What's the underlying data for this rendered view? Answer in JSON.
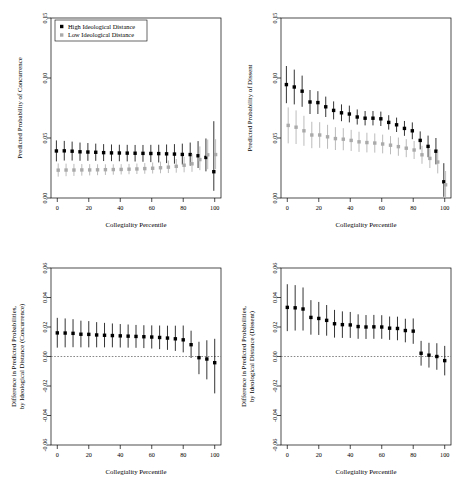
{
  "figure": {
    "background": "#ffffff",
    "series_colors": {
      "high": "#000000",
      "low": "#aaaaaa"
    }
  },
  "legend": {
    "present_on_panel": "top-left",
    "items": [
      {
        "label": "High Ideological Distance",
        "marker": "filled-square",
        "color": "#000000"
      },
      {
        "label": "Low Ideological Distance",
        "marker": "filled-square",
        "color": "#aaaaaa"
      }
    ]
  },
  "chart_data": [
    {
      "id": "panel-concurrence",
      "type": "scatter",
      "position": "top-left",
      "title": "",
      "xlabel": "Collegiality Percentile",
      "ylabel": "Predicted Probability of Concurrence",
      "xlim": [
        -4,
        104
      ],
      "ylim": [
        0.0,
        0.15
      ],
      "xticks": [
        0,
        20,
        40,
        60,
        80,
        100
      ],
      "yticks": [
        0.0,
        0.05,
        0.1,
        0.15
      ],
      "ytick_labels": [
        "0.00",
        "0.05",
        "0.10",
        "0.15"
      ],
      "xtick_labels": [
        "0",
        "20",
        "40",
        "60",
        "80",
        "100"
      ],
      "grid": false,
      "legend": "top-left",
      "x": [
        0,
        5,
        10,
        15,
        20,
        25,
        30,
        35,
        40,
        45,
        50,
        55,
        60,
        65,
        70,
        75,
        80,
        85,
        90,
        95,
        100
      ],
      "series": [
        {
          "name": "High Ideological Distance",
          "color": "#000000",
          "values": [
            0.0392,
            0.0393,
            0.039,
            0.0385,
            0.0383,
            0.0381,
            0.0378,
            0.0376,
            0.0375,
            0.0374,
            0.0373,
            0.0372,
            0.0371,
            0.037,
            0.0368,
            0.0366,
            0.0363,
            0.0362,
            0.0352,
            0.0338,
            0.0219
          ],
          "lower": [
            0.0305,
            0.0312,
            0.0312,
            0.031,
            0.031,
            0.031,
            0.0308,
            0.0307,
            0.0306,
            0.0305,
            0.0304,
            0.0302,
            0.0299,
            0.0296,
            0.0291,
            0.0286,
            0.0279,
            0.0269,
            0.025,
            0.0222,
            0.006
          ],
          "upper": [
            0.048,
            0.0476,
            0.047,
            0.0462,
            0.0458,
            0.0453,
            0.0449,
            0.0446,
            0.0444,
            0.0443,
            0.0442,
            0.0442,
            0.0443,
            0.0444,
            0.0446,
            0.0449,
            0.0453,
            0.0462,
            0.0474,
            0.0496,
            0.064
          ]
        },
        {
          "name": "Low Ideological Distance",
          "color": "#aaaaaa",
          "values": [
            0.0232,
            0.0233,
            0.0233,
            0.0234,
            0.0234,
            0.0235,
            0.0236,
            0.0237,
            0.0238,
            0.024,
            0.0242,
            0.0245,
            0.0248,
            0.0252,
            0.0257,
            0.0264,
            0.0273,
            0.0285,
            0.032,
            0.036,
            0.0362
          ],
          "lower": [
            0.0178,
            0.0182,
            0.0184,
            0.0186,
            0.0188,
            0.019,
            0.0192,
            0.0194,
            0.0196,
            0.0198,
            0.02,
            0.0202,
            0.0204,
            0.0206,
            0.0208,
            0.0211,
            0.0214,
            0.0218,
            0.0232,
            0.024,
            0.024
          ],
          "upper": [
            0.0288,
            0.0286,
            0.0284,
            0.0283,
            0.0282,
            0.0281,
            0.0281,
            0.0281,
            0.0282,
            0.0284,
            0.0287,
            0.0291,
            0.0296,
            0.0303,
            0.0312,
            0.0325,
            0.0343,
            0.0368,
            0.043,
            0.0487,
            0.049
          ]
        }
      ]
    },
    {
      "id": "panel-dissent",
      "type": "scatter",
      "position": "top-right",
      "title": "",
      "xlabel": "Collegiality Percentile",
      "ylabel": "Predicted Probability of Dissent",
      "xlim": [
        -4,
        104
      ],
      "ylim": [
        0.0,
        0.15
      ],
      "xticks": [
        0,
        20,
        40,
        60,
        80,
        100
      ],
      "yticks": [
        0.0,
        0.05,
        0.1,
        0.15
      ],
      "ytick_labels": [
        "0.00",
        "0.05",
        "0.10",
        "0.15"
      ],
      "xtick_labels": [
        "0",
        "20",
        "40",
        "60",
        "80",
        "100"
      ],
      "grid": false,
      "legend": "none",
      "x": [
        0,
        5,
        10,
        15,
        20,
        25,
        30,
        35,
        40,
        45,
        50,
        55,
        60,
        65,
        70,
        75,
        80,
        85,
        90,
        95,
        100
      ],
      "series": [
        {
          "name": "High Ideological Distance",
          "color": "#000000",
          "values": [
            0.0945,
            0.0925,
            0.089,
            0.08,
            0.0795,
            0.076,
            0.073,
            0.071,
            0.07,
            0.0675,
            0.0665,
            0.0665,
            0.066,
            0.063,
            0.061,
            0.058,
            0.056,
            0.048,
            0.043,
            0.039,
            0.0135
          ],
          "lower": [
            0.079,
            0.078,
            0.076,
            0.07,
            0.07,
            0.0675,
            0.0655,
            0.064,
            0.063,
            0.0612,
            0.0605,
            0.0605,
            0.06,
            0.057,
            0.055,
            0.0518,
            0.049,
            0.0405,
            0.034,
            0.028,
            0.001
          ],
          "upper": [
            0.11,
            0.107,
            0.102,
            0.09,
            0.089,
            0.0845,
            0.0805,
            0.078,
            0.077,
            0.0738,
            0.0725,
            0.0725,
            0.072,
            0.069,
            0.067,
            0.0642,
            0.063,
            0.0555,
            0.052,
            0.05,
            0.029
          ]
        },
        {
          "name": "Low Ideological Distance",
          "color": "#aaaaaa",
          "values": [
            0.0605,
            0.059,
            0.056,
            0.0525,
            0.0525,
            0.051,
            0.0495,
            0.049,
            0.048,
            0.0468,
            0.0462,
            0.0458,
            0.045,
            0.044,
            0.0428,
            0.0415,
            0.04,
            0.036,
            0.033,
            0.03,
            0.011
          ],
          "lower": [
            0.0455,
            0.045,
            0.0435,
            0.0415,
            0.0418,
            0.041,
            0.04,
            0.0398,
            0.0392,
            0.0384,
            0.038,
            0.0378,
            0.0372,
            0.0364,
            0.0352,
            0.034,
            0.0325,
            0.0285,
            0.025,
            0.0205,
            0.0005
          ],
          "upper": [
            0.0755,
            0.073,
            0.0685,
            0.0635,
            0.0632,
            0.061,
            0.059,
            0.0582,
            0.0568,
            0.0552,
            0.0544,
            0.0538,
            0.0528,
            0.0516,
            0.0504,
            0.049,
            0.0475,
            0.0435,
            0.041,
            0.0395,
            0.0225
          ]
        }
      ]
    },
    {
      "id": "panel-diff-concurrence",
      "type": "scatter",
      "position": "bottom-left",
      "title": "",
      "xlabel": "Collegiality Percentile",
      "ylabel": "Difference in Predicted Probabilities, by Ideological Distance (Concurrence)",
      "xlim": [
        -4,
        104
      ],
      "ylim": [
        -0.06,
        0.06
      ],
      "xticks": [
        0,
        20,
        40,
        60,
        80,
        100
      ],
      "yticks": [
        -0.06,
        -0.04,
        -0.02,
        0.0,
        0.02,
        0.04,
        0.06
      ],
      "ytick_labels": [
        "-0.06",
        "-0.04",
        "-0.02",
        "0.00",
        "0.02",
        "0.04",
        "0.06"
      ],
      "xtick_labels": [
        "0",
        "20",
        "40",
        "60",
        "80",
        "100"
      ],
      "grid": false,
      "reference_line": 0.0,
      "legend": "none",
      "x": [
        0,
        5,
        10,
        15,
        20,
        25,
        30,
        35,
        40,
        45,
        50,
        55,
        60,
        65,
        70,
        75,
        80,
        85,
        90,
        95,
        100
      ],
      "series": [
        {
          "name": "Difference",
          "color": "#000000",
          "values": [
            0.016,
            0.0159,
            0.0157,
            0.0151,
            0.015,
            0.0146,
            0.0144,
            0.0142,
            0.014,
            0.0138,
            0.0136,
            0.0134,
            0.0132,
            0.0129,
            0.0125,
            0.012,
            0.0113,
            0.008,
            -0.0008,
            -0.0017,
            -0.0042
          ],
          "lower": [
            0.006,
            0.0062,
            0.0063,
            0.0062,
            0.0062,
            0.0062,
            0.0062,
            0.0062,
            0.0061,
            0.006,
            0.0059,
            0.0057,
            0.0054,
            0.005,
            0.0045,
            0.0038,
            0.0028,
            -0.001,
            -0.012,
            -0.0155,
            -0.025
          ],
          "upper": [
            0.0262,
            0.0258,
            0.0253,
            0.0243,
            0.024,
            0.0233,
            0.0228,
            0.0224,
            0.022,
            0.0217,
            0.0214,
            0.0212,
            0.0211,
            0.021,
            0.0209,
            0.0209,
            0.021,
            0.0175,
            0.01,
            0.011,
            0.012
          ]
        }
      ]
    },
    {
      "id": "panel-diff-dissent",
      "type": "scatter",
      "position": "bottom-right",
      "title": "",
      "xlabel": "Collegiality Percentile",
      "ylabel": "Difference in Predicted Probabilities, by Ideological Distance (Dissent)",
      "xlim": [
        -4,
        104
      ],
      "ylim": [
        -0.06,
        0.06
      ],
      "xticks": [
        0,
        20,
        40,
        60,
        80,
        100
      ],
      "yticks": [
        -0.06,
        -0.04,
        -0.02,
        0.0,
        0.02,
        0.04,
        0.06
      ],
      "ytick_labels": [
        "-0.06",
        "-0.04",
        "-0.02",
        "0.00",
        "0.02",
        "0.04",
        "0.06"
      ],
      "xtick_labels": [
        "0",
        "20",
        "40",
        "60",
        "80",
        "100"
      ],
      "grid": false,
      "reference_line": 0.0,
      "legend": "none",
      "x": [
        0,
        5,
        10,
        15,
        20,
        25,
        30,
        35,
        40,
        45,
        50,
        55,
        60,
        65,
        70,
        75,
        80,
        85,
        90,
        95,
        100
      ],
      "series": [
        {
          "name": "Difference",
          "color": "#000000",
          "values": [
            0.0333,
            0.033,
            0.0322,
            0.0265,
            0.0258,
            0.0245,
            0.0222,
            0.0216,
            0.0214,
            0.0203,
            0.02,
            0.0201,
            0.02,
            0.0192,
            0.019,
            0.0176,
            0.0172,
            0.0022,
            0.0009,
            0.0,
            -0.0028
          ],
          "lower": [
            0.0172,
            0.0176,
            0.0176,
            0.0148,
            0.0146,
            0.0141,
            0.0128,
            0.0126,
            0.0126,
            0.012,
            0.0119,
            0.012,
            0.012,
            0.0113,
            0.011,
            0.0096,
            0.0086,
            -0.0062,
            -0.0075,
            -0.009,
            -0.0128
          ],
          "upper": [
            0.049,
            0.0484,
            0.0468,
            0.0382,
            0.037,
            0.0349,
            0.0316,
            0.0306,
            0.0302,
            0.0286,
            0.0281,
            0.0282,
            0.028,
            0.0271,
            0.027,
            0.0256,
            0.0258,
            0.0106,
            0.0093,
            0.009,
            0.0072
          ]
        }
      ]
    }
  ]
}
